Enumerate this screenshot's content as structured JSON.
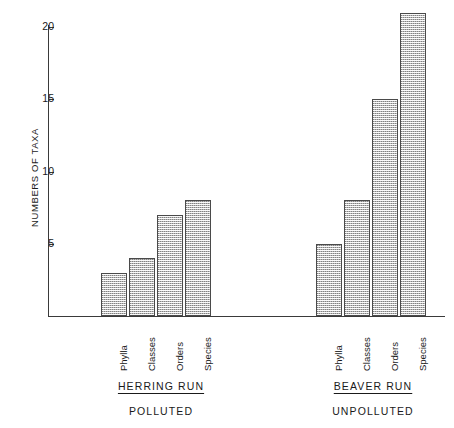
{
  "chart_data": {
    "type": "bar",
    "title": "",
    "xlabel": "",
    "ylabel": "NUMBERS OF TAXA",
    "ylim": [
      0,
      21.5
    ],
    "yticks": [
      5,
      10,
      15,
      20
    ],
    "ytick_labels": [
      "5",
      "10",
      "15",
      "20"
    ],
    "grid": false,
    "legend": false,
    "categories": [
      "Phylla",
      "Classes",
      "Orders",
      "Species"
    ],
    "groups": [
      {
        "name": "HERRING RUN",
        "subtitle": "POLLUTED",
        "values": [
          3,
          4,
          7,
          8
        ]
      },
      {
        "name": "BEAVER RUN",
        "subtitle": "UNPOLLUTED",
        "values": [
          5,
          8,
          15,
          21
        ]
      }
    ],
    "series": [
      {
        "name": "HERRING RUN",
        "values": [
          3,
          4,
          7,
          8
        ]
      },
      {
        "name": "BEAVER RUN",
        "values": [
          5,
          8,
          15,
          21
        ]
      }
    ],
    "bar_fill": "#b9b9b9",
    "bar_edge": "#4a4a4a",
    "axis_color": "#3a3a3a",
    "background": "#ffffff"
  },
  "axis": {
    "y_label": "NUMBERS OF TAXA",
    "ticks": [
      {
        "value": 20,
        "label": "20"
      },
      {
        "value": 15,
        "label": "15"
      },
      {
        "value": 10,
        "label": "10"
      },
      {
        "value": 5,
        "label": "5"
      }
    ]
  },
  "left_group": {
    "title": "HERRING RUN",
    "subtitle": "POLLUTED",
    "bars": [
      {
        "label": "Phylla",
        "value": 3
      },
      {
        "label": "Classes",
        "value": 4
      },
      {
        "label": "Orders",
        "value": 7
      },
      {
        "label": "Species",
        "value": 8
      }
    ]
  },
  "right_group": {
    "title": "BEAVER RUN",
    "subtitle": "UNPOLLUTED",
    "bars": [
      {
        "label": "Phylla",
        "value": 5
      },
      {
        "label": "Classes",
        "value": 8
      },
      {
        "label": "Orders",
        "value": 15
      },
      {
        "label": "Species",
        "value": 21
      }
    ]
  }
}
